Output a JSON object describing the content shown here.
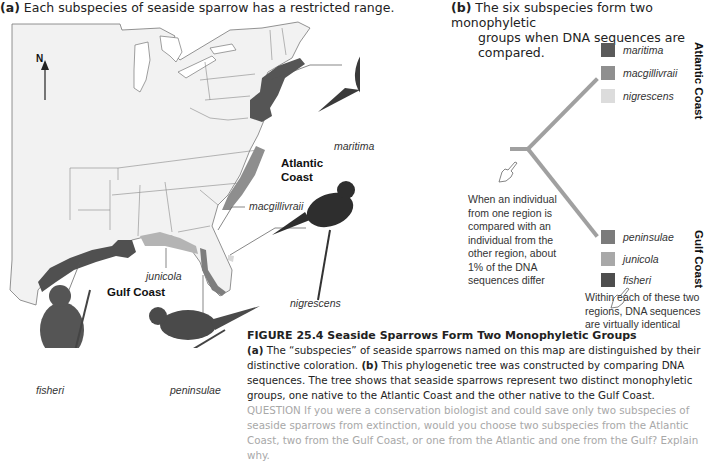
{
  "panel_a": {
    "label": "(a)",
    "title": "Each subspecies of seaside sparrow has a restricted range.",
    "north_label": "N",
    "region_labels": {
      "atlantic": [
        "Atlantic",
        "Coast"
      ],
      "gulf": "Gulf Coast"
    },
    "subspecies_labels": {
      "maritima": "maritima",
      "macgillivraii": "macgillivraii",
      "nigrescens": "nigrescens",
      "junicola": "junicola",
      "fisheri": "fisheri",
      "peninsulae": "peninsulae"
    }
  },
  "panel_b": {
    "label": "(b)",
    "title_line1": "The six subspecies form two monophyletic",
    "title_line2": "groups when DNA sequences are compared.",
    "atlantic_group": {
      "heading": "Atlantic Coast",
      "members": [
        {
          "name": "maritima",
          "color": "#5a5a5a"
        },
        {
          "name": "macgillivraii",
          "color": "#8f8f8f"
        },
        {
          "name": "nigrescens",
          "color": "#dcdcdc"
        }
      ]
    },
    "gulf_group": {
      "heading": "Gulf Coast",
      "members": [
        {
          "name": "peninsulae",
          "color": "#7b7b7b"
        },
        {
          "name": "junicola",
          "color": "#a8a8a8"
        },
        {
          "name": "fisheri",
          "color": "#4e4e4e"
        }
      ]
    },
    "note_between": [
      "When an individual",
      "from one region is",
      "compared with an",
      "individual from the",
      "other region, about",
      "1% of the DNA",
      "sequences differ"
    ],
    "note_within": [
      "Within each of these two",
      "regions, DNA sequences",
      "are virtually identical"
    ],
    "branch_color": "#a0a0a0"
  },
  "caption": {
    "figure_title": "FIGURE 25.4  Seaside Sparrows Form Two Monophyletic Groups",
    "a_label": "(a)",
    "a_text": "The “subspecies” of seaside sparrows named on this map are distinguished by their distinctive coloration.",
    "b_label": "(b)",
    "b_text": "This phylogenetic tree was constructed by comparing DNA sequences. The tree shows that seaside sparrows represent two distinct monophyletic groups, one native to the Atlantic Coast and the other native to the Gulf Coast.",
    "question_label": "QUESTION",
    "question_text": "If you were a conservation biologist and could save only two subspecies of seaside sparrows from extinction, would you choose two subspecies from the Atlantic Coast, two from the Gulf Coast, or one from the Atlantic and one from the Gulf? Explain why."
  }
}
